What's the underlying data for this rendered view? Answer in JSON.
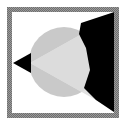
{
  "figure": {
    "canvas": {
      "width": 133,
      "height": 126,
      "background_color": "#ffffff"
    },
    "frame": {
      "name": "border-frame",
      "x": 7,
      "y": 7,
      "width": 112,
      "height": 111,
      "thickness": 5,
      "color": "#8c8c8c",
      "style": "dithered-gray"
    },
    "shapes": [
      {
        "name": "sphere",
        "type": "circle",
        "cx": 64,
        "cy": 62,
        "r": 35,
        "fill_color": "#c9c9c9",
        "label": "gray sphere"
      },
      {
        "name": "light-cone",
        "type": "polygon",
        "fill_color": "#e2e2e2",
        "apex_x": 30,
        "apex_y": 63,
        "points": "30,63 106,18 106,108",
        "label": "light cone from point source"
      },
      {
        "name": "source-marker",
        "type": "polygon",
        "fill_color": "#000000",
        "points": "13,63 31,53 31,73",
        "label": "left pointing black triangle marker"
      },
      {
        "name": "shadow-wedge",
        "type": "polygon",
        "fill_color": "#000000",
        "points": "82,22 118,11 118,113 98,99 84,86 93,56 82,40",
        "label": "black shadow wedge"
      }
    ],
    "colors": {
      "black": "#000000",
      "sphere_gray": "#c9c9c9",
      "cone_gray": "#e2e2e2",
      "frame_gray": "#8c8c8c",
      "white": "#ffffff"
    }
  }
}
